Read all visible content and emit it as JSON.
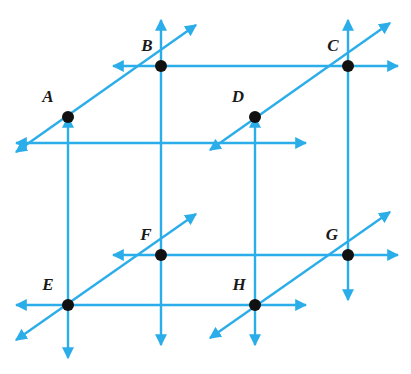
{
  "figure": {
    "type": "geometry-diagram",
    "line_color": "#2badea",
    "point_color": "#111111",
    "label_color": "#1a1a1a",
    "background": "#ffffff",
    "points": [
      {
        "id": "A",
        "label": "A",
        "x": 68,
        "y": 117,
        "label_x": 48,
        "label_y": 102
      },
      {
        "id": "B",
        "label": "B",
        "x": 161,
        "y": 66,
        "label_x": 147,
        "label_y": 51
      },
      {
        "id": "C",
        "label": "C",
        "x": 348,
        "y": 66,
        "label_x": 333,
        "label_y": 51
      },
      {
        "id": "D",
        "label": "D",
        "x": 255,
        "y": 117,
        "label_x": 238,
        "label_y": 102
      },
      {
        "id": "E",
        "label": "E",
        "x": 68,
        "y": 305,
        "label_x": 48,
        "label_y": 290
      },
      {
        "id": "F",
        "label": "F",
        "x": 161,
        "y": 255,
        "label_x": 146,
        "label_y": 240
      },
      {
        "id": "G",
        "label": "G",
        "x": 348,
        "y": 255,
        "label_x": 332,
        "label_y": 240
      },
      {
        "id": "H",
        "label": "H",
        "x": 255,
        "y": 305,
        "label_x": 239,
        "label_y": 290
      }
    ],
    "lines": [
      {
        "id": "line-A-D",
        "from": "A",
        "to": "D",
        "x1": 16,
        "y1": 143,
        "x2": 306,
        "y2": 143,
        "note": "horizontal through A and D with arrows both ends"
      },
      {
        "id": "line-B-C",
        "from": "B",
        "to": "C",
        "x1": 113,
        "y1": 66,
        "x2": 398,
        "y2": 66,
        "note": "horizontal through B and C with arrows both ends"
      },
      {
        "id": "line-F-G",
        "from": "F",
        "to": "G",
        "x1": 113,
        "y1": 255,
        "x2": 398,
        "y2": 255,
        "note": "horizontal through F and G with arrows both ends"
      },
      {
        "id": "line-E-H",
        "from": "E",
        "to": "H",
        "x1": 16,
        "y1": 305,
        "x2": 306,
        "y2": 305,
        "note": "horizontal through E and H with arrows both ends"
      },
      {
        "id": "line-A-E",
        "from": "A",
        "to": "E",
        "x1": 68,
        "y1": 117,
        "x2": 68,
        "y2": 358,
        "note": "vertical through A and E"
      },
      {
        "id": "line-B-F",
        "from": "B",
        "to": "F",
        "x1": 161,
        "y1": 20,
        "x2": 161,
        "y2": 345,
        "note": "vertical through B and F"
      },
      {
        "id": "line-C-G",
        "from": "C",
        "to": "G",
        "x1": 348,
        "y1": 20,
        "x2": 348,
        "y2": 300,
        "note": "vertical through C and G"
      },
      {
        "id": "line-D-H",
        "from": "D",
        "to": "H",
        "x1": 255,
        "y1": 117,
        "x2": 255,
        "y2": 345,
        "note": "vertical through D and H"
      },
      {
        "id": "line-diag-A-B",
        "from": "A",
        "to": "B",
        "x1": 16,
        "y1": 152,
        "x2": 196,
        "y2": 25,
        "note": "diagonal through A and B"
      },
      {
        "id": "line-diag-D-C",
        "from": "D",
        "to": "C",
        "x1": 210,
        "y1": 150,
        "x2": 390,
        "y2": 23,
        "note": "diagonal through D and C"
      },
      {
        "id": "line-diag-E-F",
        "from": "E",
        "to": "F",
        "x1": 16,
        "y1": 340,
        "x2": 196,
        "y2": 214,
        "note": "diagonal through E and F"
      },
      {
        "id": "line-diag-H-G",
        "from": "H",
        "to": "G",
        "x1": 210,
        "y1": 338,
        "x2": 390,
        "y2": 212,
        "note": "diagonal through H and G"
      }
    ]
  }
}
